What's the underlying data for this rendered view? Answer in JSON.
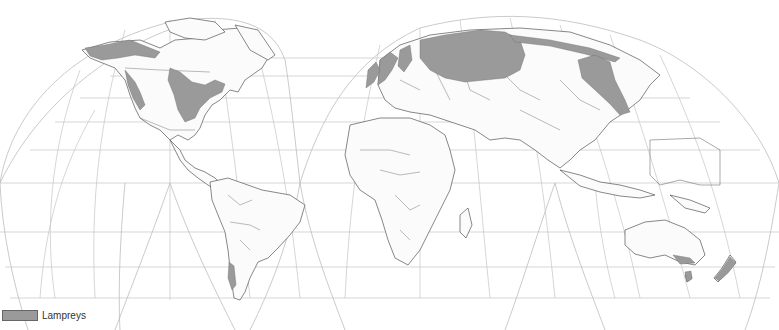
{
  "map": {
    "title": "Lamprey distribution world map",
    "projection": "interrupted (Goode homolosine style)",
    "colors": {
      "range_fill": "#9a9a9a",
      "land_fill": "#fbfbfb",
      "coast_stroke": "#555555",
      "graticule": "#c4c4c4",
      "background": "#ffffff"
    }
  },
  "legend": {
    "items": [
      {
        "label": "Lampreys",
        "color": "#9a9a9a"
      }
    ]
  }
}
